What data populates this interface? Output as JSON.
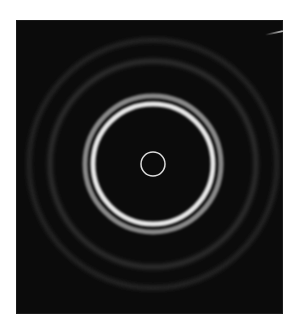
{
  "image": {
    "subject": "Electron diffraction ring pattern",
    "background_color": "#0b0b0b",
    "page_color": "#ffffff",
    "center": [
      137,
      144
    ],
    "rings": [
      {
        "name": "central-beam-ring",
        "radius": 12,
        "width": 1.5,
        "color": "#e8e8e8",
        "opacity": 0.95
      },
      {
        "name": "bright-inner-ring",
        "radius": 60,
        "width": 5,
        "color": "#f2f2f2",
        "opacity": 0.95
      },
      {
        "name": "second-ring",
        "radius": 68,
        "width": 5,
        "color": "#bdbdbd",
        "opacity": 0.7
      },
      {
        "name": "faint-ring-3",
        "radius": 103,
        "width": 4,
        "color": "#5a5a5a",
        "opacity": 0.55
      },
      {
        "name": "faint-ring-4",
        "radius": 124,
        "width": 4,
        "color": "#4a4a4a",
        "opacity": 0.5
      }
    ]
  }
}
